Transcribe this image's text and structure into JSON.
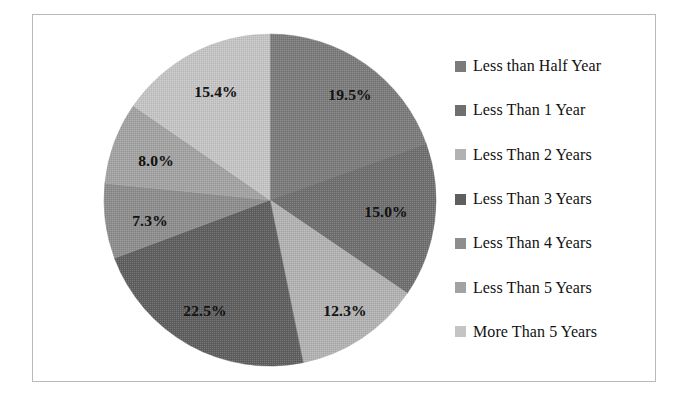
{
  "chart_data": {
    "type": "pie",
    "title": "",
    "subtitle": "",
    "xlabel": "",
    "ylabel": "",
    "legend_position": "right",
    "grid": false,
    "units": "percent",
    "start_angle_deg": 0,
    "direction": "clockwise",
    "categories": [
      "Less than Half Year",
      "Less Than 1 Year",
      "Less Than 2 Years",
      "Less Than 3 Years",
      "Less Than 4 Years",
      "Less Than 5 Years",
      "More Than 5 Years"
    ],
    "values": [
      19.5,
      15.0,
      12.3,
      22.5,
      7.3,
      8.0,
      15.4
    ],
    "data_labels": [
      "19.5%",
      "15.0%",
      "12.3%",
      "22.5%",
      "7.3%",
      "8.0%",
      "15.4%"
    ],
    "colors": [
      "#7b7b7b",
      "#6f6f6f",
      "#b2b2b2",
      "#5f5f5f",
      "#8d8d8d",
      "#a2a2a2",
      "#c4c4c4"
    ],
    "slices": [
      {
        "label": "Less than Half Year",
        "value": 19.5,
        "data_label": "19.5%",
        "color": "#7b7b7b"
      },
      {
        "label": "Less Than 1 Year",
        "value": 15.0,
        "data_label": "15.0%",
        "color": "#6f6f6f"
      },
      {
        "label": "Less Than 2 Years",
        "value": 12.3,
        "data_label": "12.3%",
        "color": "#b2b2b2"
      },
      {
        "label": "Less Than 3 Years",
        "value": 22.5,
        "data_label": "22.5%",
        "color": "#5f5f5f"
      },
      {
        "label": "Less Than 4 Years",
        "value": 7.3,
        "data_label": "7.3%",
        "color": "#8d8d8d"
      },
      {
        "label": "Less Than 5 Years",
        "value": 8.0,
        "data_label": "8.0%",
        "color": "#a2a2a2"
      },
      {
        "label": "More Than 5 Years",
        "value": 15.4,
        "data_label": "15.4%",
        "color": "#c4c4c4"
      }
    ]
  },
  "legend": {
    "items": [
      {
        "label": "Less than Half Year",
        "color": "#7b7b7b"
      },
      {
        "label": "Less Than 1 Year",
        "color": "#6f6f6f"
      },
      {
        "label": "Less Than 2 Years",
        "color": "#b2b2b2"
      },
      {
        "label": "Less Than 3 Years",
        "color": "#5f5f5f"
      },
      {
        "label": "Less Than 4 Years",
        "color": "#8d8d8d"
      },
      {
        "label": "Less Than 5 Years",
        "color": "#a2a2a2"
      },
      {
        "label": "More Than 5 Years",
        "color": "#c4c4c4"
      }
    ]
  },
  "frame": {
    "border_color": "#b9b9b9",
    "background": "#ffffff"
  },
  "label_positions": [
    {
      "data_label": "19.5%",
      "x": 350,
      "y": 95
    },
    {
      "data_label": "15.0%",
      "x": 386,
      "y": 212
    },
    {
      "data_label": "12.3%",
      "x": 345,
      "y": 311
    },
    {
      "data_label": "22.5%",
      "x": 205,
      "y": 311
    },
    {
      "data_label": "7.3%",
      "x": 150,
      "y": 221
    },
    {
      "data_label": "8.0%",
      "x": 156,
      "y": 161
    },
    {
      "data_label": "15.4%",
      "x": 216,
      "y": 92
    }
  ]
}
